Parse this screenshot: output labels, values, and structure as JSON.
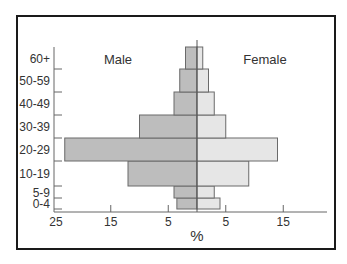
{
  "chart_data": {
    "type": "bar",
    "subtype": "population-pyramid",
    "title": "",
    "xlabel": "%",
    "ylabel": "",
    "categories": [
      "0-4",
      "5-9",
      "10-19",
      "20-29",
      "30-39",
      "40-49",
      "50-59",
      "60+"
    ],
    "series": [
      {
        "name": "Male",
        "side": "left",
        "color": "#bdbdbd",
        "values": [
          3.5,
          4,
          12,
          23,
          10,
          4,
          3,
          2
        ]
      },
      {
        "name": "Female",
        "side": "right",
        "color": "#e6e6e6",
        "values": [
          4,
          3,
          9,
          14,
          5,
          3,
          2,
          1
        ]
      }
    ],
    "x_tick_labels_left": [
      "25",
      "15",
      "5"
    ],
    "x_tick_values_left": [
      25,
      15,
      5
    ],
    "x_tick_labels_right": [
      "5",
      "15"
    ],
    "x_tick_values_right": [
      5,
      15
    ],
    "xlim": [
      -25,
      22
    ],
    "grid": false,
    "legend": {
      "position": "in-plot top",
      "entries": [
        "Male",
        "Female"
      ]
    }
  },
  "labels": {
    "male": "Male",
    "female": "Female",
    "x_axis": "%"
  },
  "colors": {
    "male_bar": "#bdbdbd",
    "female_bar": "#e6e6e6",
    "axis": "#555555",
    "frame": "#1a1a1a",
    "text": "#333333"
  }
}
